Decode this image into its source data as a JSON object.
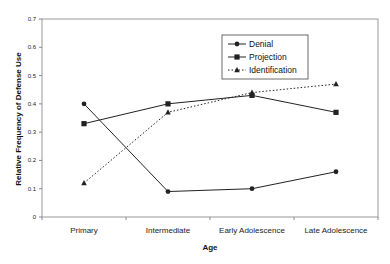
{
  "chart_data": {
    "type": "line",
    "title": "",
    "xlabel": "Age",
    "ylabel": "Relative Frequency of Defense Use",
    "categories": [
      "Primary",
      "Intermediate",
      "Early Adolescence",
      "Late Adolescence"
    ],
    "ylim": [
      0,
      0.7
    ],
    "yticks": [
      "0",
      "0.1",
      "0.2",
      "0.3",
      "0.4",
      "0.5",
      "0.6",
      "0.7"
    ],
    "grid": false,
    "legend_position": "upper-center-right, inside plot",
    "series": [
      {
        "name": "Denial",
        "marker": "circle",
        "line": "solid",
        "values": [
          0.4,
          0.09,
          0.1,
          0.16
        ]
      },
      {
        "name": "Projection",
        "marker": "square",
        "line": "solid",
        "values": [
          0.33,
          0.4,
          0.43,
          0.37
        ]
      },
      {
        "name": "Identification",
        "marker": "triangle",
        "line": "dotted",
        "values": [
          0.12,
          0.37,
          0.44,
          0.47
        ]
      }
    ]
  },
  "legend": {
    "items": [
      "Denial",
      "Projection",
      "Identification"
    ]
  },
  "colors": {
    "line": "#222222",
    "axis": "#888888",
    "frame": "#999999"
  }
}
